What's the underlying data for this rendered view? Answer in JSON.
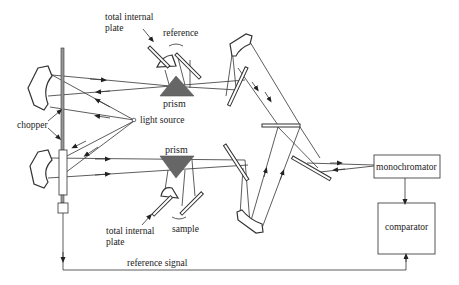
{
  "diagram": {
    "labels": {
      "tir_plate_top_line1": "total internal",
      "tir_plate_top_line2": "plate",
      "reference": "reference",
      "prism_top": "prism",
      "light_source": "light source",
      "chopper": "chopper",
      "prism_bottom": "prism",
      "tir_plate_bottom_line1": "total internal",
      "tir_plate_bottom_line2": "plate",
      "sample": "sample",
      "monochromator": "monochromator",
      "comparator": "comparator",
      "reference_signal": "reference signal"
    },
    "colors": {
      "line": "#333333",
      "prism_fill": "#666666",
      "background": "#ffffff"
    }
  }
}
